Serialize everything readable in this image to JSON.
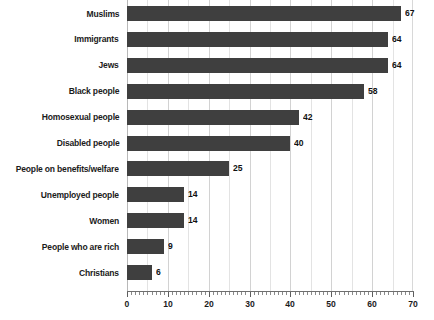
{
  "chart_data": {
    "type": "bar",
    "orientation": "horizontal",
    "title": "",
    "subtitle": "",
    "xlabel": "",
    "ylabel": "",
    "categories": [
      "Muslims",
      "Immigrants",
      "Jews",
      "Black people",
      "Homosexual people",
      "Disabled people",
      "People on benefits/welfare",
      "Unemployed people",
      "Women",
      "People who are rich",
      "Christians"
    ],
    "values": [
      67,
      64,
      64,
      58,
      42,
      40,
      25,
      14,
      14,
      9,
      6
    ],
    "value_labels": [
      "67",
      "64",
      "64",
      "58",
      "42",
      "40",
      "25",
      "14",
      "14",
      "9",
      "6"
    ],
    "xlim": [
      0,
      70
    ],
    "x_tick_labels": [
      "0",
      "10",
      "20",
      "30",
      "40",
      "50",
      "60",
      "70"
    ],
    "x_tick_values": [
      0,
      10,
      20,
      30,
      40,
      50,
      60,
      70
    ],
    "x_minor_tick_step": 1,
    "gridline_values": [
      5,
      10,
      15,
      20,
      25,
      30,
      35,
      40,
      45,
      50,
      55,
      60,
      65
    ],
    "grid": true,
    "legend": false,
    "legend_position": "none",
    "bar_color": "#3f3f3f",
    "grid_color": "#e3e3e3",
    "axis_color": "#6e6e6e",
    "text_color": "#1b1b1b",
    "background_color": "#ffffff"
  }
}
